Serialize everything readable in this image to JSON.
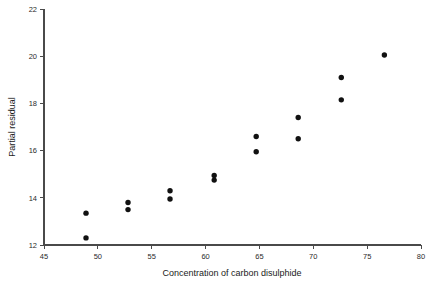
{
  "chart_data": {
    "type": "scatter",
    "title": "",
    "xlabel": "Concentration of carbon disulphide",
    "ylabel": "Partial residual",
    "xlim": [
      45,
      80
    ],
    "ylim": [
      12,
      22
    ],
    "xticks": [
      45,
      50,
      55,
      60,
      65,
      70,
      75,
      80
    ],
    "yticks": [
      12,
      14,
      16,
      18,
      20,
      22
    ],
    "grid": false,
    "legend": null,
    "marker": "filled-circle",
    "marker_color": "#111111",
    "points": [
      {
        "x": 48.9,
        "y": 12.3
      },
      {
        "x": 48.9,
        "y": 13.35
      },
      {
        "x": 52.8,
        "y": 13.5
      },
      {
        "x": 52.8,
        "y": 13.8
      },
      {
        "x": 56.7,
        "y": 13.95
      },
      {
        "x": 56.7,
        "y": 14.3
      },
      {
        "x": 60.8,
        "y": 14.75
      },
      {
        "x": 60.8,
        "y": 14.95
      },
      {
        "x": 64.7,
        "y": 15.95
      },
      {
        "x": 64.7,
        "y": 16.6
      },
      {
        "x": 68.6,
        "y": 16.5
      },
      {
        "x": 68.6,
        "y": 17.4
      },
      {
        "x": 72.6,
        "y": 18.15
      },
      {
        "x": 72.6,
        "y": 19.1
      },
      {
        "x": 76.6,
        "y": 20.05
      }
    ]
  },
  "axes": {
    "x_tick_labels": [
      "45",
      "50",
      "55",
      "60",
      "65",
      "70",
      "75",
      "80"
    ],
    "y_tick_labels": [
      "12",
      "14",
      "16",
      "18",
      "20",
      "22"
    ],
    "x_axis_title": "Concentration of carbon disulphide",
    "y_axis_title": "Partial residual"
  },
  "colors": {
    "axis": "#4a4a4a",
    "text": "#1a1a1a",
    "marker": "#111111",
    "background": "#ffffff"
  }
}
